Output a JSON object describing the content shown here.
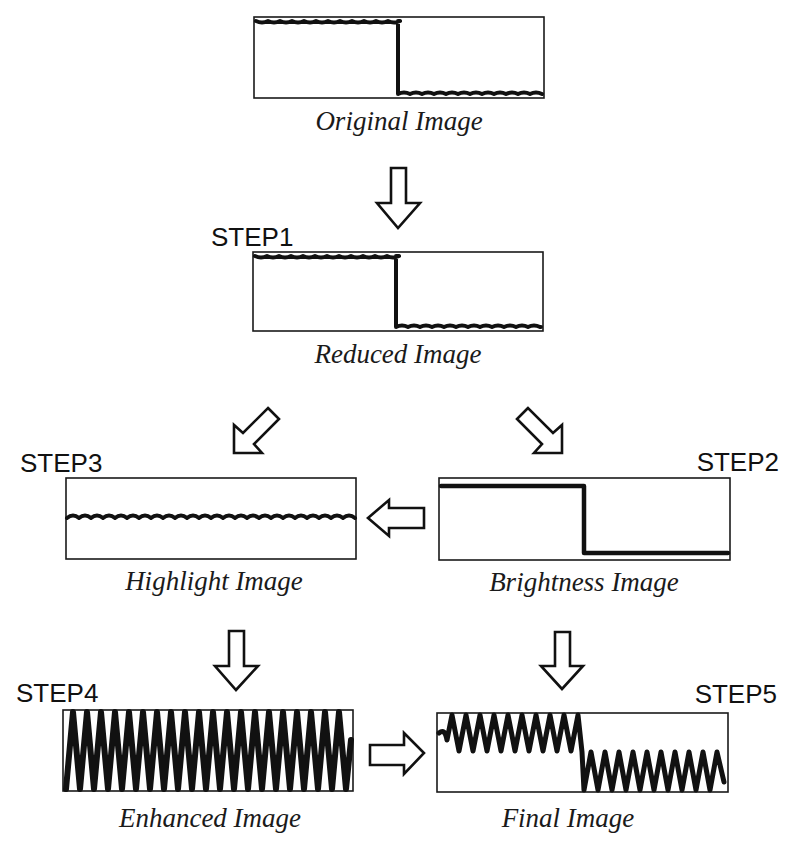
{
  "diagram": {
    "colors": {
      "ink": "#111111",
      "background": "#ffffff"
    },
    "nodes": {
      "original": {
        "caption": "Original Image",
        "step": ""
      },
      "reduced": {
        "caption": "Reduced Image",
        "step": "STEP1"
      },
      "brightness": {
        "caption": "Brightness Image",
        "step": "STEP2"
      },
      "highlight": {
        "caption": "Highlight Image",
        "step": "STEP3"
      },
      "enhanced": {
        "caption": "Enhanced Image",
        "step": "STEP4"
      },
      "final": {
        "caption": "Final Image",
        "step": "STEP5"
      }
    },
    "edges": [
      {
        "from": "original",
        "to": "reduced",
        "arrow": "down-arrow"
      },
      {
        "from": "reduced",
        "to": "highlight",
        "arrow": "down-left-arrow"
      },
      {
        "from": "reduced",
        "to": "brightness",
        "arrow": "down-right-arrow"
      },
      {
        "from": "brightness",
        "to": "highlight",
        "arrow": "left-arrow"
      },
      {
        "from": "highlight",
        "to": "enhanced",
        "arrow": "down-arrow"
      },
      {
        "from": "brightness",
        "to": "final",
        "arrow": "down-arrow"
      },
      {
        "from": "enhanced",
        "to": "final",
        "arrow": "right-arrow"
      }
    ]
  }
}
